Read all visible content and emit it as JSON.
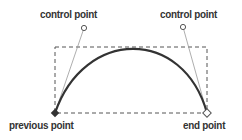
{
  "labels": {
    "control_point_1": "control point",
    "control_point_2": "control point",
    "previous_point": "previous point",
    "end_point": "end point"
  },
  "colors": {
    "curve": "#333333",
    "handle_line": "#999999",
    "dashed_box": "#555555",
    "text": "#333333"
  },
  "geometry": {
    "previous_point": [
      55,
      113
    ],
    "control_point_1": [
      84,
      28
    ],
    "control_point_2": [
      183,
      27
    ],
    "end_point": [
      207,
      113
    ],
    "bounding_box": {
      "x": 55,
      "y": 47,
      "width": 152,
      "height": 66
    }
  }
}
